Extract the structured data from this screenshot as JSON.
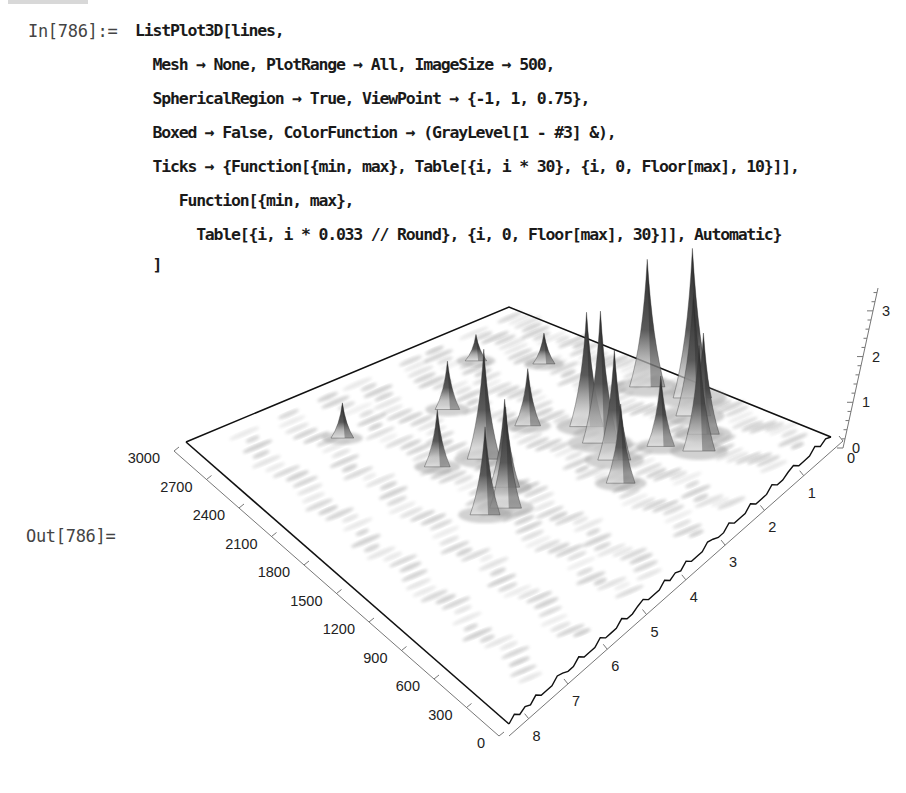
{
  "notebook": {
    "input_label": "In[786]:=",
    "output_label": "Out[786]=",
    "code_lines": [
      "ListPlot3D[lines,",
      "  Mesh → None, PlotRange → All, ImageSize → 500,",
      "  SphericalRegion → True, ViewPoint → {-1, 1, 0.75},",
      "  Boxed → False, ColorFunction → (GrayLevel[1 - #3] &),",
      "  Ticks → {Function[{min, max}, Table[{i, i * 30}, {i, 0, Floor[max], 10}]],",
      "     Function[{min, max},",
      "       Table[{i, i * 0.033 // Round}, {i, 0, Floor[max], 30}]], Automatic}",
      "  ]"
    ]
  },
  "chart_data": {
    "type": "surface3d",
    "title": "",
    "function": "ListPlot3D",
    "options": {
      "Mesh": "None",
      "PlotRange": "All",
      "ImageSize": 500,
      "SphericalRegion": "True",
      "ViewPoint": [
        -1,
        1,
        0.75
      ],
      "Boxed": "False",
      "ColorFunction": "GrayLevel[1 - #3] &"
    },
    "axes": {
      "y_ticks": [
        "0",
        "300",
        "600",
        "900",
        "1200",
        "1500",
        "1800",
        "2100",
        "2400",
        "2700",
        "3000"
      ],
      "x_ticks": [
        "0",
        "1",
        "2",
        "3",
        "4",
        "5",
        "6",
        "7",
        "8"
      ],
      "z_ticks": [
        "0",
        "1",
        "2",
        "3"
      ],
      "y_range": [
        0,
        3000
      ],
      "x_range": [
        0,
        8.5
      ],
      "z_range": [
        0,
        3.5
      ]
    },
    "colors": {
      "surface_high": "#2a2a2a",
      "surface_low": "#ffffff",
      "edge": "#111111",
      "axis": "#666666"
    },
    "peaks": [
      {
        "x": 0.4,
        "y": 1150,
        "z": 3.4
      },
      {
        "x": 0.8,
        "y": 1000,
        "z": 2.8
      },
      {
        "x": 1.1,
        "y": 800,
        "z": 2.3
      },
      {
        "x": 0.6,
        "y": 1500,
        "z": 2.9
      },
      {
        "x": 1.5,
        "y": 700,
        "z": 2.4
      },
      {
        "x": 1.8,
        "y": 950,
        "z": 1.6
      },
      {
        "x": 2.2,
        "y": 1500,
        "z": 2.6
      },
      {
        "x": 2.4,
        "y": 1300,
        "z": 3.0
      },
      {
        "x": 2.6,
        "y": 1100,
        "z": 2.5
      },
      {
        "x": 3.0,
        "y": 900,
        "z": 1.8
      },
      {
        "x": 2.9,
        "y": 1800,
        "z": 1.3
      },
      {
        "x": 4.2,
        "y": 1750,
        "z": 2.5
      },
      {
        "x": 4.5,
        "y": 1450,
        "z": 2.0
      },
      {
        "x": 4.9,
        "y": 1300,
        "z": 2.3
      },
      {
        "x": 5.3,
        "y": 1350,
        "z": 2.0
      },
      {
        "x": 5.0,
        "y": 1900,
        "z": 1.3
      },
      {
        "x": 3.6,
        "y": 2300,
        "z": 1.1
      },
      {
        "x": 5.8,
        "y": 2500,
        "z": 0.8
      },
      {
        "x": 1.2,
        "y": 2250,
        "z": 0.7
      },
      {
        "x": 2.0,
        "y": 2600,
        "z": 0.6
      }
    ],
    "ridges_note": "Data arranged in bands of peaks running along the y-axis direction, highest near x≈0.5–3"
  }
}
